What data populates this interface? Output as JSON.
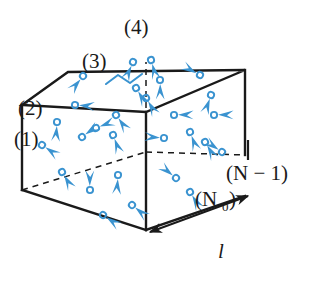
{
  "figure": {
    "colors": {
      "particle_blue": "#3a93d0",
      "particle_blue_light": "#6fb7e2",
      "edge_black": "#1a1a1a",
      "background": "#ffffff"
    },
    "labels": [
      {
        "id": "level-1",
        "text": "(1)",
        "x": 14,
        "y": 138,
        "size": 21
      },
      {
        "id": "level-2",
        "text": "(2)",
        "x": 18,
        "y": 110,
        "size": 21
      },
      {
        "id": "level-3",
        "text": "(3)",
        "x": 84,
        "y": 64,
        "size": 21
      },
      {
        "id": "level-4",
        "text": "(4)",
        "x": 124,
        "y": 30,
        "size": 21
      },
      {
        "id": "level-N0",
        "text": "(N",
        "x": 196,
        "y": 198,
        "size": 21
      },
      {
        "id": "level-N0-sub",
        "text": "0",
        "x": 220,
        "y": 203,
        "size": 13
      },
      {
        "id": "level-N0-close",
        "text": ")",
        "x": 227,
        "y": 198,
        "size": 21
      },
      {
        "id": "level-Nminus1",
        "text": "(N − 1)",
        "x": 228,
        "y": 172,
        "size": 21
      },
      {
        "id": "length-l",
        "text": "l",
        "x": 222,
        "y": 253,
        "size": 20
      }
    ],
    "label_texts": {
      "level_1": "(1)",
      "level_2": "(2)",
      "level_3": "(3)",
      "level_4": "(4)",
      "level_n0": "(N",
      "level_n0_subscript": "0",
      "level_n0_close": ")",
      "level_n_minus_1": "(N − 1)",
      "length": "l"
    },
    "box": {
      "description": "rectangular box drawn in oblique projection, solid visible edges, dashed hidden edges",
      "front_top_left": [
        22,
        105
      ],
      "front_top_right": [
        146,
        112
      ],
      "front_bottom_left": [
        22,
        190
      ],
      "front_bottom_right": [
        146,
        230
      ],
      "back_top_left": [
        68,
        72
      ],
      "back_top_right": [
        245,
        70
      ],
      "interior_corner": [
        146,
        152
      ],
      "right_bottom": [
        245,
        155
      ]
    },
    "particles": [
      {
        "cx": 42,
        "cy": 145,
        "angle": 35,
        "note": "level-1 region"
      },
      {
        "cx": 57,
        "cy": 122,
        "angle": 95
      },
      {
        "cx": 62,
        "cy": 172,
        "angle": 60
      },
      {
        "cx": 75,
        "cy": 105,
        "angle": 5
      },
      {
        "cx": 82,
        "cy": 137,
        "angle": -35
      },
      {
        "cx": 90,
        "cy": 190,
        "angle": -90
      },
      {
        "cx": 103,
        "cy": 215,
        "angle": 35
      },
      {
        "cx": 118,
        "cy": 175,
        "angle": 95
      },
      {
        "cx": 132,
        "cy": 205,
        "angle": 40
      },
      {
        "cx": 83,
        "cy": 76,
        "angle": 130
      },
      {
        "cx": 113,
        "cy": 135,
        "angle": 70
      },
      {
        "cx": 116,
        "cy": 115,
        "angle": 55
      },
      {
        "cx": 133,
        "cy": 62,
        "angle": 115
      },
      {
        "cx": 151,
        "cy": 60,
        "angle": 75
      },
      {
        "cx": 136,
        "cy": 88,
        "angle": 60
      },
      {
        "cx": 160,
        "cy": 80,
        "angle": 90
      },
      {
        "cx": 200,
        "cy": 75,
        "angle": 210
      },
      {
        "cx": 211,
        "cy": 95,
        "angle": 110
      },
      {
        "cx": 174,
        "cy": 115,
        "angle": 0
      },
      {
        "cx": 214,
        "cy": 115,
        "angle": 0
      },
      {
        "cx": 164,
        "cy": 138,
        "angle": 185
      },
      {
        "cx": 190,
        "cy": 132,
        "angle": 70
      },
      {
        "cx": 205,
        "cy": 142,
        "angle": 60
      },
      {
        "cx": 222,
        "cy": 152,
        "angle": 215
      },
      {
        "cx": 176,
        "cy": 178,
        "angle": 220
      },
      {
        "cx": 190,
        "cy": 192,
        "angle": 60
      },
      {
        "cx": 146,
        "cy": 98,
        "angle": 60
      },
      {
        "cx": 96,
        "cy": 128,
        "angle": 340
      }
    ],
    "trajectory": {
      "description": "zigzag bounce path polyline on top face",
      "points": "106,84 118,75 130,83 142,74"
    },
    "dimension": {
      "label": "l",
      "description": "double headed arrow measuring depth edge"
    }
  }
}
